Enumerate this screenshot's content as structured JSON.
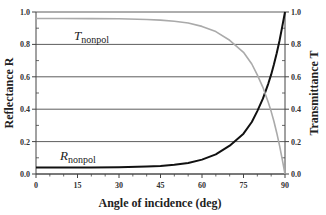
{
  "chart_data": {
    "type": "line",
    "title": "",
    "xlabel": "Angle of incidence (deg)",
    "ylabel_left": "Reflectance R",
    "ylabel_right": "Transmittance T",
    "xlim": [
      0,
      90
    ],
    "ylim": [
      0.0,
      1.0
    ],
    "x_ticks": [
      "0",
      "15",
      "30",
      "45",
      "60",
      "75",
      "90"
    ],
    "y_ticks_left": [
      "0.0",
      "0.2",
      "0.4",
      "0.6",
      "0.8",
      "1.0"
    ],
    "y_ticks_right": [
      "0.0",
      "0.2",
      "0.4",
      "0.6",
      "0.8",
      "1.0"
    ],
    "grid": "horizontal",
    "x": [
      0,
      10,
      20,
      30,
      40,
      45,
      50,
      55,
      60,
      65,
      70,
      75,
      78,
      80,
      82,
      84,
      85,
      86,
      87,
      88,
      89,
      90
    ],
    "series": [
      {
        "name": "R_nonpol",
        "label_main": "R",
        "label_sub": "nonpol",
        "color": "#111111",
        "values": [
          0.04,
          0.04,
          0.041,
          0.042,
          0.046,
          0.05,
          0.057,
          0.068,
          0.089,
          0.121,
          0.175,
          0.249,
          0.321,
          0.388,
          0.465,
          0.56,
          0.615,
          0.675,
          0.745,
          0.823,
          0.908,
          1.0
        ]
      },
      {
        "name": "T_nonpol",
        "label_main": "T",
        "label_sub": "nonpol",
        "color": "#aaaaaa",
        "values": [
          0.96,
          0.96,
          0.959,
          0.958,
          0.954,
          0.95,
          0.943,
          0.932,
          0.911,
          0.879,
          0.825,
          0.751,
          0.679,
          0.612,
          0.535,
          0.44,
          0.385,
          0.325,
          0.255,
          0.177,
          0.092,
          0.0
        ]
      }
    ],
    "legend": "inline labels on curves"
  },
  "labels": {
    "xlabel": "Angle of incidence (deg)",
    "ylabel_left": "Reflectance R",
    "ylabel_right": "Transmittance T",
    "r_main": "R",
    "r_sub": "nonpol",
    "t_main": "T",
    "t_sub": "nonpol"
  }
}
